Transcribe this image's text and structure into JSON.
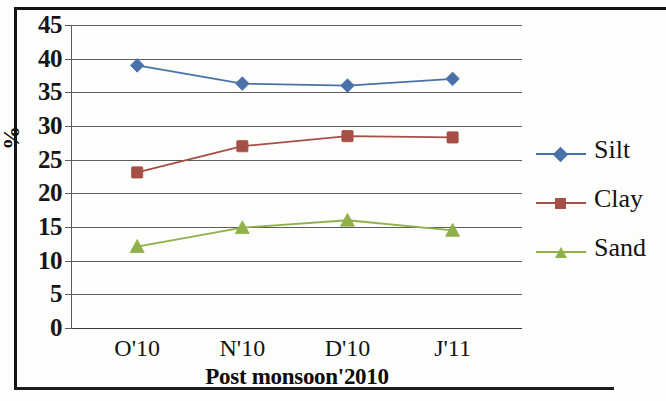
{
  "chart_data": {
    "type": "line",
    "title": "",
    "xlabel": "Post monsoon'2010",
    "ylabel": "%",
    "categories": [
      "O'10",
      "N'10",
      "D'10",
      "J'11"
    ],
    "series": [
      {
        "name": "Silt",
        "color": "#4a72a8",
        "marker": "diamond",
        "values": [
          39.0,
          36.3,
          36.0,
          37.0
        ]
      },
      {
        "name": "Clay",
        "color": "#a54f46",
        "marker": "square",
        "values": [
          23.1,
          27.0,
          28.5,
          28.3
        ]
      },
      {
        "name": "Sand",
        "color": "#8fb04a",
        "marker": "triangle",
        "values": [
          12.1,
          14.9,
          16.0,
          14.5
        ]
      }
    ],
    "ylim": [
      0,
      45
    ],
    "ytick_step": 5,
    "yticks": [
      "45",
      "40",
      "35",
      "30",
      "25",
      "20",
      "15",
      "10",
      "5",
      "0"
    ],
    "grid": true,
    "legend_position": "right"
  },
  "legend": {
    "items": [
      {
        "label": "Silt"
      },
      {
        "label": "Clay"
      },
      {
        "label": "Sand"
      }
    ]
  },
  "axes": {
    "y_title": "%",
    "x_title": "Post monsoon'2010"
  }
}
